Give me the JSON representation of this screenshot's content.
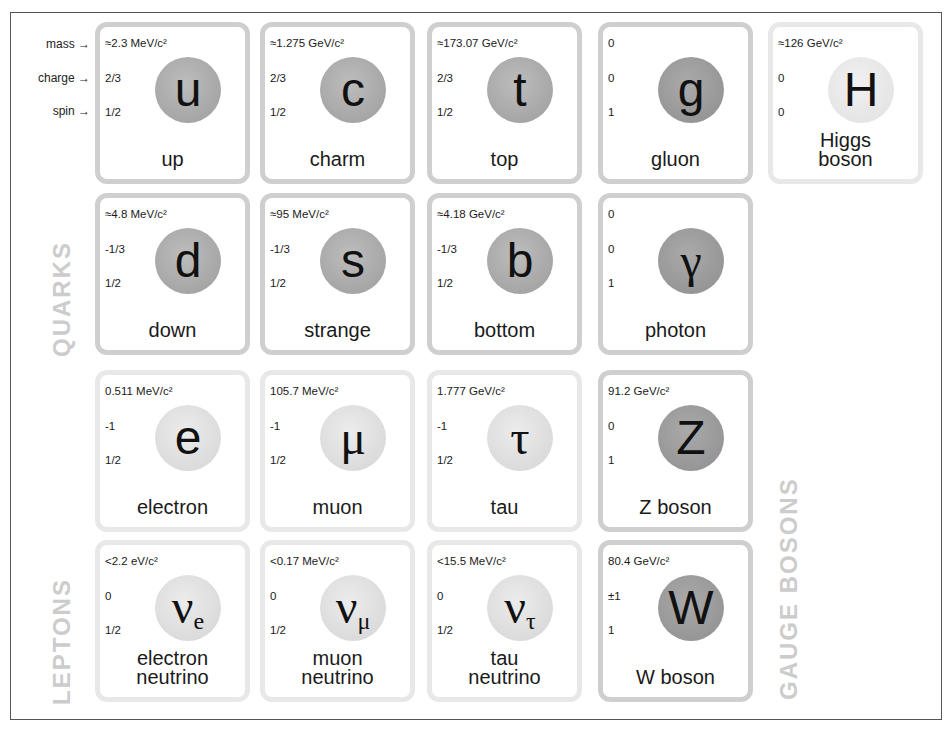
{
  "legend": {
    "mass": "mass →",
    "charge": "charge →",
    "spin": "spin →"
  },
  "groups": {
    "quarks": "QUARKS",
    "leptons": "LEPTONS",
    "gauge_bosons": "GAUGE BOSONS"
  },
  "colors": {
    "quark_circle": "#a8a8a8",
    "boson_circle": "#999999",
    "lepton_circle": "#dddddd",
    "higgs_circle": "#e6e6e6",
    "dark_border": "#cfcfcf",
    "light_border": "#e8e8e8",
    "group_label": "#cccccc"
  },
  "particles": {
    "up": {
      "mass": "≈2.3 MeV/c²",
      "charge": "2/3",
      "spin": "1/2",
      "symbol": "u",
      "sub": "",
      "name": "up"
    },
    "charm": {
      "mass": "≈1.275 GeV/c²",
      "charge": "2/3",
      "spin": "1/2",
      "symbol": "c",
      "sub": "",
      "name": "charm"
    },
    "top": {
      "mass": "≈173.07 GeV/c²",
      "charge": "2/3",
      "spin": "1/2",
      "symbol": "t",
      "sub": "",
      "name": "top"
    },
    "gluon": {
      "mass": "0",
      "charge": "0",
      "spin": "1",
      "symbol": "g",
      "sub": "",
      "name": "gluon"
    },
    "higgs": {
      "mass": "≈126 GeV/c²",
      "charge": "0",
      "spin": "0",
      "symbol": "H",
      "sub": "",
      "name": "Higgs boson"
    },
    "down": {
      "mass": "≈4.8 MeV/c²",
      "charge": "-1/3",
      "spin": "1/2",
      "symbol": "d",
      "sub": "",
      "name": "down"
    },
    "strange": {
      "mass": "≈95 MeV/c²",
      "charge": "-1/3",
      "spin": "1/2",
      "symbol": "s",
      "sub": "",
      "name": "strange"
    },
    "bottom": {
      "mass": "≈4.18 GeV/c²",
      "charge": "-1/3",
      "spin": "1/2",
      "symbol": "b",
      "sub": "",
      "name": "bottom"
    },
    "photon": {
      "mass": "0",
      "charge": "0",
      "spin": "1",
      "symbol": "γ",
      "sub": "",
      "name": "photon"
    },
    "electron": {
      "mass": "0.511 MeV/c²",
      "charge": "-1",
      "spin": "1/2",
      "symbol": "e",
      "sub": "",
      "name": "electron"
    },
    "muon": {
      "mass": "105.7 MeV/c²",
      "charge": "-1",
      "spin": "1/2",
      "symbol": "μ",
      "sub": "",
      "name": "muon"
    },
    "tau": {
      "mass": "1.777 GeV/c²",
      "charge": "-1",
      "spin": "1/2",
      "symbol": "τ",
      "sub": "",
      "name": "tau"
    },
    "z": {
      "mass": "91.2 GeV/c²",
      "charge": "0",
      "spin": "1",
      "symbol": "Z",
      "sub": "",
      "name": "Z boson"
    },
    "nu_e": {
      "mass": "<2.2 eV/c²",
      "charge": "0",
      "spin": "1/2",
      "symbol": "ν",
      "sub": "e",
      "name_l1": "electron",
      "name_l2": "neutrino"
    },
    "nu_mu": {
      "mass": "<0.17 MeV/c²",
      "charge": "0",
      "spin": "1/2",
      "symbol": "ν",
      "sub": "μ",
      "name_l1": "muon",
      "name_l2": "neutrino"
    },
    "nu_tau": {
      "mass": "<15.5 MeV/c²",
      "charge": "0",
      "spin": "1/2",
      "symbol": "ν",
      "sub": "τ",
      "name_l1": "tau",
      "name_l2": "neutrino"
    },
    "w": {
      "mass": "80.4 GeV/c²",
      "charge": "±1",
      "spin": "1",
      "symbol": "W",
      "sub": "",
      "name": "W boson"
    }
  },
  "higgs_name": {
    "l1": "Higgs",
    "l2": "boson"
  }
}
